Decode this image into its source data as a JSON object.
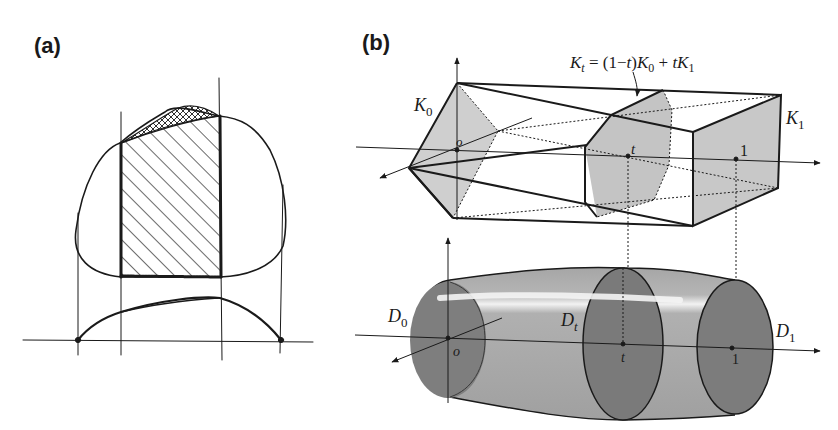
{
  "figure": {
    "panel_a": {
      "label": "(a)"
    },
    "panel_b": {
      "label": "(b)",
      "formula": {
        "lhs": "K",
        "lhs_sub": "t",
        "rhs_part1": " = (1−",
        "rhs_t1": "t",
        "rhs_part2": ")",
        "rhs_K0": "K",
        "rhs_K0_sub": "0",
        "rhs_plus": " + ",
        "rhs_t2": "t",
        "rhs_K1": "K",
        "rhs_K1_sub": "1"
      },
      "top_labels": {
        "K0": "K",
        "K0_sub": "0",
        "K1": "K",
        "K1_sub": "1",
        "origin": "o",
        "t": "t",
        "one": "1"
      },
      "bottom_labels": {
        "D0": "D",
        "D0_sub": "0",
        "Dt": "D",
        "Dt_sub": "t",
        "D1": "D",
        "D1_sub": "1",
        "origin": "o",
        "t": "t",
        "one": "1"
      }
    },
    "colors": {
      "ink": "#1a1a1a",
      "light_fill": "#c8c8c8",
      "mid_fill": "#a9a9a9",
      "dark_fill": "#7d7d7d",
      "highlight": "#f2f2f2",
      "background": "#ffffff"
    }
  }
}
